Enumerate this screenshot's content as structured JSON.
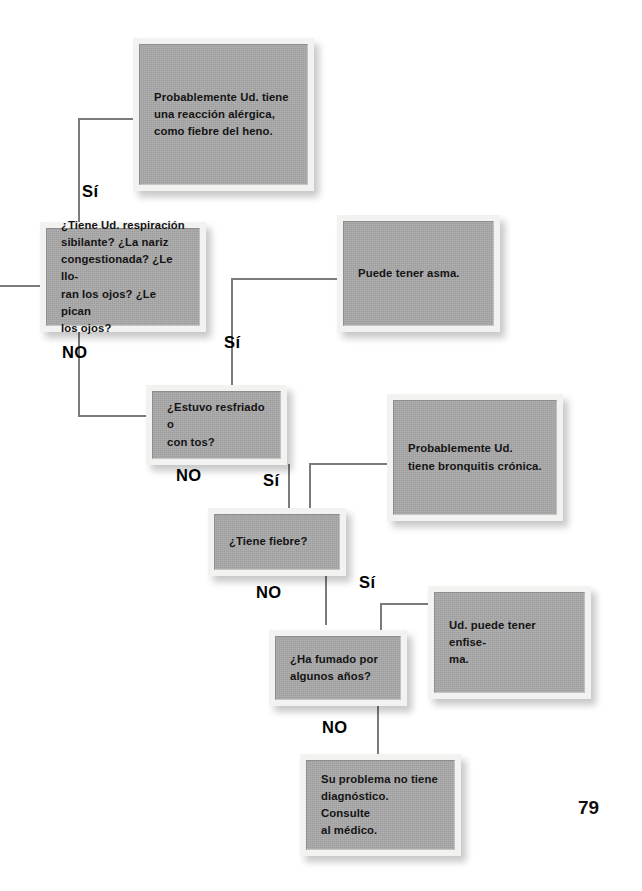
{
  "page": {
    "number": "79"
  },
  "colors": {
    "box_fill": "#a9a9a9",
    "box_frame": "#f2f2f0",
    "line": "#7b7b7b",
    "text": "#141414",
    "background": "#ffffff"
  },
  "nodes": [
    {
      "id": "allergy-outcome",
      "kind": "outcome",
      "text": "Probablemente Ud. tiene\nuna reacción alérgica,\ncomo fiebre del heno."
    },
    {
      "id": "question-wheezing",
      "kind": "question",
      "text": "¿Tiene Ud. respiración\nsibilante? ¿La nariz\ncongestionada? ¿Le llo-\nran los ojos? ¿Le pican\nlos ojos?"
    },
    {
      "id": "asthma-outcome",
      "kind": "outcome",
      "text": "Puede tener asma."
    },
    {
      "id": "question-cold-cough",
      "kind": "question",
      "text": "¿Estuvo resfriado o\ncon tos?"
    },
    {
      "id": "bronchitis-outcome",
      "kind": "outcome",
      "text": "Probablemente Ud.\ntiene bronquitis crónica."
    },
    {
      "id": "question-fever",
      "kind": "question",
      "text": "¿Tiene fiebre?"
    },
    {
      "id": "emphysema-outcome",
      "kind": "outcome",
      "text": "Ud. puede tener enfise-\nma."
    },
    {
      "id": "question-smoking",
      "kind": "question",
      "text": "¿Ha fumado por\nalgunos años?"
    },
    {
      "id": "no-diagnosis-outcome",
      "kind": "outcome",
      "text": "Su problema no tiene\ndiagnóstico. Consulte\nal médico."
    }
  ],
  "branch_labels": [
    {
      "id": "si-wheezing-to-allergy",
      "text": "Sí"
    },
    {
      "id": "no-wheezing-to-cold",
      "text": "NO"
    },
    {
      "id": "si-cold-to-asthma",
      "text": "Sí"
    },
    {
      "id": "no-cold-to-fever",
      "text": "NO"
    },
    {
      "id": "si-fever-to-bronchitis",
      "text": "Sí"
    },
    {
      "id": "no-fever-to-smoking",
      "text": "NO"
    },
    {
      "id": "si-smoking-to-emphysema",
      "text": "Sí"
    },
    {
      "id": "no-smoking-to-nodiagnosis",
      "text": "NO"
    }
  ]
}
